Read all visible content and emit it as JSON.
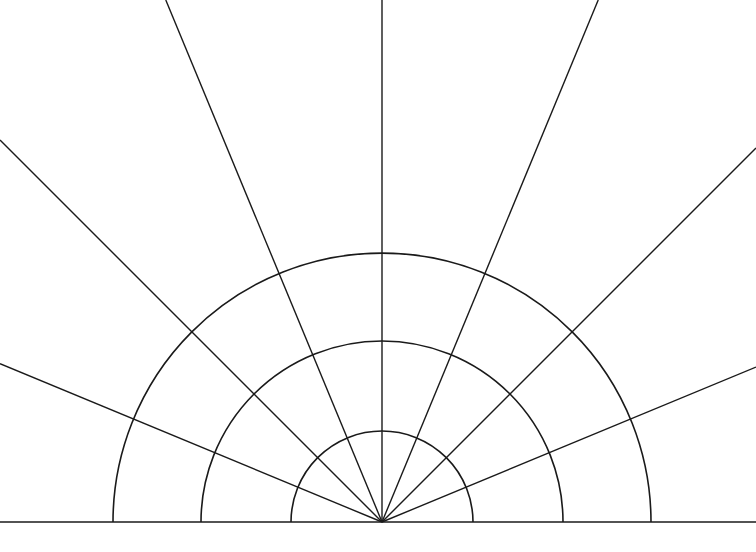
{
  "diagram": {
    "type": "polar-grid-semicircle",
    "center": {
      "x": 382,
      "y": 522
    },
    "baseline": {
      "y": 522,
      "x1": 0,
      "x2": 756
    },
    "arc_radii": [
      91,
      181,
      269
    ],
    "ray_angles_deg": [
      22.5,
      45,
      67.5,
      90,
      112.5,
      135,
      157.5
    ],
    "stroke_color": "#1a1a1a",
    "background": "#ffffff"
  }
}
